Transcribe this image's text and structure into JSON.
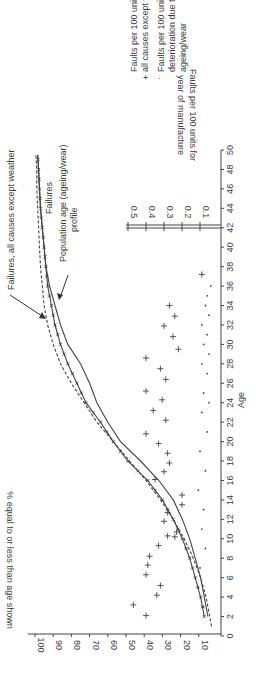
{
  "chart_data": {
    "type": "line",
    "orientation": "rotated 90 degrees counter-clockwise",
    "xlabel": "Age",
    "ylabel": "% equal to or less than age shown",
    "x_ticks": [
      0,
      2,
      4,
      6,
      8,
      10,
      12,
      14,
      16,
      18,
      20,
      22,
      24,
      26,
      28,
      30,
      32,
      34,
      36,
      38,
      40,
      42,
      44,
      46,
      48,
      50
    ],
    "y_ticks": [
      10,
      20,
      30,
      40,
      50,
      60,
      70,
      80,
      90,
      100
    ],
    "xlim": [
      0,
      50
    ],
    "ylim": [
      0,
      100
    ],
    "secondary_axis": {
      "label_line1": "Faults per 100 units for",
      "label_line2": "year of manufacture",
      "ticks": [
        0.1,
        0.2,
        0.3,
        0.4,
        0.5
      ],
      "placed_at_age": 42
    },
    "series": [
      {
        "name": "Failures, all causes except weather",
        "style": "solid-with-x-markers",
        "x": [
          2,
          4,
          6,
          8,
          10,
          12,
          14,
          16,
          18,
          20,
          22,
          24,
          26,
          28,
          30,
          32,
          34,
          36,
          38,
          40,
          42,
          44,
          46,
          48,
          49.5
        ],
        "values": [
          7,
          9,
          12,
          15,
          19,
          24,
          30,
          38,
          49,
          57,
          64,
          72,
          77,
          82,
          86,
          89,
          91,
          93,
          94,
          95,
          96,
          97,
          97.5,
          98,
          98.5
        ]
      },
      {
        "name": "Population age (ageing/wear) profile",
        "style": "solid",
        "x": [
          2,
          4,
          6,
          8,
          10,
          12,
          14,
          16,
          18,
          20,
          22,
          24,
          26,
          28,
          30,
          32,
          34,
          36,
          38,
          40,
          42,
          44,
          46,
          48,
          49.5
        ],
        "values": [
          5,
          7,
          9,
          12,
          15,
          19,
          24,
          32,
          42,
          53,
          60,
          66,
          70,
          75,
          82,
          86,
          89,
          92,
          94,
          95,
          96,
          97,
          97.5,
          98,
          98.5
        ]
      },
      {
        "name": "Failures (ageing/wear)",
        "style": "dashed",
        "x": [
          1,
          2,
          4,
          6,
          8,
          10,
          12,
          14,
          16,
          18,
          20,
          22,
          24,
          26,
          28,
          30,
          32,
          34,
          36,
          38,
          40,
          42,
          44,
          46,
          48,
          49.5
        ],
        "values": [
          3,
          4,
          6,
          9,
          13,
          18,
          24,
          31,
          39,
          48,
          57,
          66,
          73,
          80,
          86,
          90,
          93,
          95,
          96,
          97,
          97.5,
          98,
          98.5,
          99,
          99,
          99.5
        ]
      },
      {
        "name": "Faults per 100 units all causes except weather",
        "style": "plus-markers",
        "axis": "secondary",
        "points": [
          [
            2.1,
            0.4
          ],
          [
            3.2,
            0.47
          ],
          [
            4.2,
            0.34
          ],
          [
            5.2,
            0.32
          ],
          [
            6.3,
            0.4
          ],
          [
            7.3,
            0.39
          ],
          [
            8.2,
            0.38
          ],
          [
            9.3,
            0.33
          ],
          [
            10.2,
            0.24
          ],
          [
            10.3,
            0.28
          ],
          [
            10.7,
            0.23
          ],
          [
            11.8,
            0.3
          ],
          [
            12.7,
            0.28
          ],
          [
            13.5,
            0.2
          ],
          [
            14.5,
            0.2
          ],
          [
            16.1,
            0.35
          ],
          [
            16.9,
            0.3
          ],
          [
            17.8,
            0.27
          ],
          [
            18.8,
            0.28
          ],
          [
            19.8,
            0.33
          ],
          [
            20.8,
            0.4
          ],
          [
            22.2,
            0.29
          ],
          [
            23.2,
            0.36
          ],
          [
            24.3,
            0.31
          ],
          [
            25.2,
            0.4
          ],
          [
            26.4,
            0.29
          ],
          [
            27.5,
            0.32
          ],
          [
            28.6,
            0.4
          ],
          [
            29.5,
            0.22
          ],
          [
            30.8,
            0.25
          ],
          [
            31.9,
            0.3
          ],
          [
            32.9,
            0.24
          ],
          [
            34.0,
            0.27
          ],
          [
            37.2,
            0.09
          ]
        ]
      },
      {
        "name": "Faults per 100 units deterioration due to ageing/wear",
        "style": "dot-markers",
        "axis": "secondary",
        "points": [
          [
            3,
            0.08
          ],
          [
            5,
            0.11
          ],
          [
            7,
            0.1
          ],
          [
            9,
            0.07
          ],
          [
            11,
            0.09
          ],
          [
            13,
            0.08
          ],
          [
            15,
            0.11
          ],
          [
            17,
            0.07
          ],
          [
            19,
            0.1
          ],
          [
            21,
            0.06
          ],
          [
            23,
            0.09
          ],
          [
            24,
            0.05
          ],
          [
            25,
            0.08
          ],
          [
            27,
            0.06
          ],
          [
            28,
            0.09
          ],
          [
            29,
            0.05
          ],
          [
            30,
            0.08
          ],
          [
            31,
            0.06
          ],
          [
            32,
            0.09
          ],
          [
            33,
            0.05
          ],
          [
            34,
            0.07
          ],
          [
            35,
            0.06
          ],
          [
            36,
            0.04
          ]
        ]
      }
    ],
    "annotations": [
      "Failures, all causes except weather",
      "Failures",
      "Population age (ageing/wear)",
      "profile"
    ],
    "legend": [
      {
        "marker": "+",
        "line1": "Faults per 100 units",
        "line2": "all causes except weather"
      },
      {
        "marker": "·",
        "line1": "Faults per 100 units",
        "line2": "deterioration due to",
        "line3": "ageing/wear"
      }
    ],
    "grid": false
  },
  "labels": {
    "xlabel": "Age",
    "ylabel": "% equal to or less than age shown",
    "inset_label_1": "Faults per 100 units for",
    "inset_label_2": "year of manufacture",
    "ann_all_causes": "Failures, all causes except weather",
    "ann_failures": "Failures",
    "ann_population_1": "Population age (ageing/wear)",
    "ann_population_2": "profile",
    "legend_plus_1": "Faults per 100 units",
    "legend_plus_2": "all causes except weather",
    "legend_dot_1": "Faults per 100 units",
    "legend_dot_2": "deterioration due to",
    "legend_dot_3": "ageing/wear",
    "plus_symbol": "+",
    "dot_symbol": "·"
  }
}
